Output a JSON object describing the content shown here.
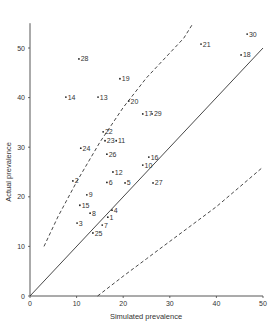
{
  "chart_data": {
    "type": "scatter",
    "title": "",
    "xlabel": "Simulated prevalence",
    "ylabel": "Actual prevalence",
    "xlim": [
      0,
      50
    ],
    "ylim": [
      0,
      55
    ],
    "xticks": [
      0,
      10,
      20,
      30,
      40,
      50
    ],
    "yticks": [
      0,
      10,
      20,
      30,
      40,
      50
    ],
    "grid": false,
    "legend": null,
    "points": [
      {
        "label": "1",
        "x": 16.7,
        "y": 15.9
      },
      {
        "label": "2",
        "x": 9.2,
        "y": 23.2
      },
      {
        "label": "3",
        "x": 10.1,
        "y": 14.7
      },
      {
        "label": "4",
        "x": 17.6,
        "y": 17.3
      },
      {
        "label": "5",
        "x": 20.4,
        "y": 22.8
      },
      {
        "label": "6",
        "x": 16.5,
        "y": 22.9
      },
      {
        "label": "7",
        "x": 15.5,
        "y": 14.3
      },
      {
        "label": "8",
        "x": 12.9,
        "y": 16.7
      },
      {
        "label": "9",
        "x": 12.2,
        "y": 20.4
      },
      {
        "label": "10",
        "x": 24.2,
        "y": 26.4
      },
      {
        "label": "11",
        "x": 18.5,
        "y": 31.3
      },
      {
        "label": "12",
        "x": 17.8,
        "y": 25.0
      },
      {
        "label": "13",
        "x": 14.6,
        "y": 40.1
      },
      {
        "label": "14",
        "x": 7.7,
        "y": 40.1
      },
      {
        "label": "15",
        "x": 10.7,
        "y": 18.3
      },
      {
        "label": "16",
        "x": 25.5,
        "y": 28.0
      },
      {
        "label": "17",
        "x": 24.2,
        "y": 36.7
      },
      {
        "label": "18",
        "x": 45.3,
        "y": 48.6
      },
      {
        "label": "19",
        "x": 19.3,
        "y": 43.8
      },
      {
        "label": "20",
        "x": 21.2,
        "y": 39.3
      },
      {
        "label": "21",
        "x": 36.7,
        "y": 50.8
      },
      {
        "label": "22",
        "x": 15.7,
        "y": 33.1
      },
      {
        "label": "23",
        "x": 16.1,
        "y": 31.3
      },
      {
        "label": "24",
        "x": 10.9,
        "y": 29.8
      },
      {
        "label": "25",
        "x": 13.5,
        "y": 12.7
      },
      {
        "label": "26",
        "x": 16.5,
        "y": 28.6
      },
      {
        "label": "27",
        "x": 26.4,
        "y": 22.8
      },
      {
        "label": "28",
        "x": 10.5,
        "y": 47.8
      },
      {
        "label": "29",
        "x": 26.2,
        "y": 36.7
      },
      {
        "label": "30",
        "x": 46.6,
        "y": 52.8
      }
    ],
    "lines": [
      {
        "name": "identity",
        "style": "solid",
        "points": [
          [
            0,
            0
          ],
          [
            50,
            50
          ]
        ]
      },
      {
        "name": "upper-bound",
        "style": "dashed",
        "points": [
          [
            3,
            10
          ],
          [
            6,
            16
          ],
          [
            10,
            23
          ],
          [
            15,
            31
          ],
          [
            20,
            38
          ],
          [
            25,
            44
          ],
          [
            30,
            49
          ],
          [
            33,
            52
          ],
          [
            35,
            55
          ]
        ]
      },
      {
        "name": "lower-bound",
        "style": "dashed",
        "points": [
          [
            14.5,
            0
          ],
          [
            20,
            4
          ],
          [
            25,
            7.5
          ],
          [
            30,
            11
          ],
          [
            35,
            14.5
          ],
          [
            40,
            18
          ],
          [
            45,
            22
          ],
          [
            50,
            26
          ]
        ]
      }
    ]
  },
  "labels": {
    "xlabel": "Simulated prevalence",
    "ylabel": "Actual prevalence"
  }
}
